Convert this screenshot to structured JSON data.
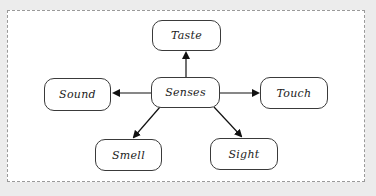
{
  "diagram": {
    "type": "mind-map",
    "center": {
      "id": "senses",
      "label": "Senses"
    },
    "nodes": [
      {
        "id": "taste",
        "label": "Taste"
      },
      {
        "id": "sound",
        "label": "Sound"
      },
      {
        "id": "touch",
        "label": "Touch"
      },
      {
        "id": "smell",
        "label": "Smell"
      },
      {
        "id": "sight",
        "label": "Sight"
      }
    ],
    "edges": [
      {
        "from": "senses",
        "to": "taste"
      },
      {
        "from": "senses",
        "to": "sound"
      },
      {
        "from": "senses",
        "to": "touch"
      },
      {
        "from": "senses",
        "to": "smell"
      },
      {
        "from": "senses",
        "to": "sight"
      }
    ],
    "colors": {
      "stroke": "#1a1a1a",
      "background": "#ececec",
      "canvas": "#ffffff"
    }
  }
}
